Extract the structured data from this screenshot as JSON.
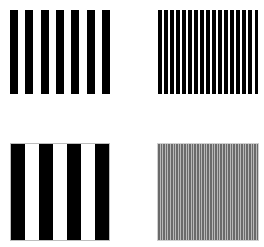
{
  "figure": {
    "panels": [
      {
        "id": "top-left",
        "label": "low-medium frequency grating",
        "bars": 7,
        "bar_color": "#000000",
        "background": "#ffffff",
        "bordered": false
      },
      {
        "id": "top-right",
        "label": "high frequency grating",
        "bars": 17,
        "bar_color": "#000000",
        "background": "#ffffff",
        "bordered": false
      },
      {
        "id": "bottom-left",
        "label": "low frequency grating",
        "bars": 4,
        "bar_color": "#000000",
        "background": "#ffffff",
        "bordered": true
      },
      {
        "id": "bottom-right",
        "label": "very high frequency grating (appears gray)",
        "bars": 40,
        "bar_color": "#6a6a6a",
        "background": "#b8b8b8",
        "bordered": true
      }
    ]
  }
}
